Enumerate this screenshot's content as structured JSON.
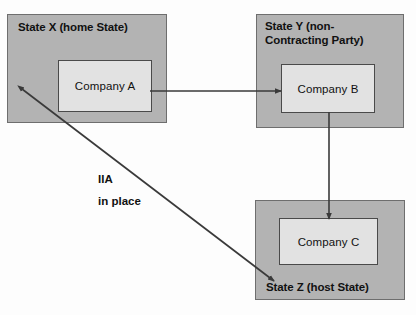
{
  "diagram": {
    "background_color": "#fdfdfd",
    "state_fill_color": "#b3b3b3",
    "company_fill_color": "#e2e2e2",
    "line_color": "#3a3a3a",
    "states": [
      {
        "id": "state-x",
        "label": "State X (home State)",
        "label_position": "top",
        "company": {
          "id": "company-a",
          "label": "Company A"
        }
      },
      {
        "id": "state-y",
        "label": "State Y (non-\nContracting Party)",
        "label_position": "top",
        "company": {
          "id": "company-b",
          "label": "Company B"
        }
      },
      {
        "id": "state-z",
        "label": "State Z (host State)",
        "label_position": "bottom",
        "company": {
          "id": "company-c",
          "label": "Company C"
        }
      }
    ],
    "connectors": [
      {
        "id": "arrow-a-to-b",
        "from": "company-a",
        "to": "company-b",
        "heads": "single",
        "orientation": "horizontal"
      },
      {
        "id": "arrow-b-to-c",
        "from": "company-b",
        "to": "company-c",
        "heads": "single",
        "orientation": "vertical"
      },
      {
        "id": "arrow-x-to-z",
        "from": "state-x",
        "to": "state-z",
        "heads": "double",
        "orientation": "diagonal",
        "label": "IIA\nin place"
      }
    ],
    "annotations": [
      {
        "id": "iia-label",
        "text": "IIA\nin place"
      }
    ]
  }
}
